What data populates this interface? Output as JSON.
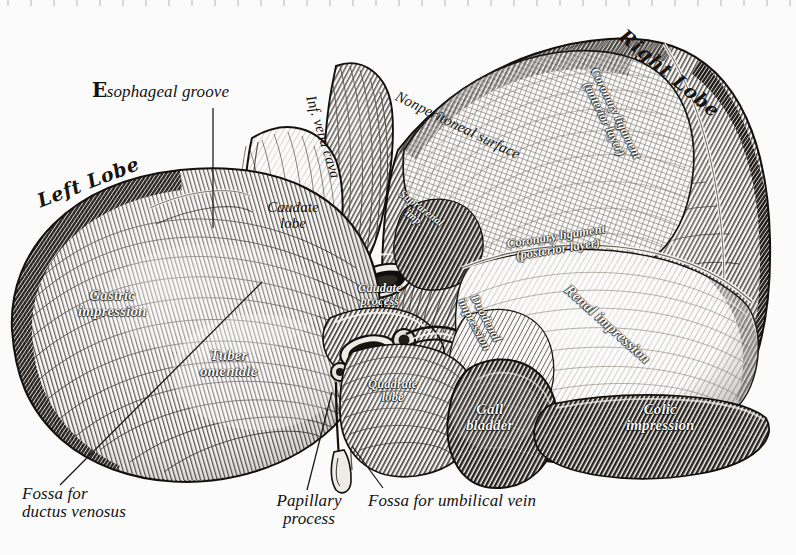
{
  "figure": {
    "style": "steel engraving, monochrome hatched line art",
    "background_color": "#ffffff",
    "ink_color": "#1a1714",
    "highlight_color": "#fdfcf8"
  },
  "labels": {
    "esophageal_groove": "Esophageal groove",
    "esophageal_groove_initial": "E",
    "esophageal_groove_rest": "sophageal groove",
    "left_lobe": "Left Lobe",
    "right_lobe": "Right Lobe",
    "caudate_lobe_l1": "Caudate",
    "caudate_lobe_l2": "lobe",
    "inf_vena_cava": "Inf. vena cava",
    "nonperitoneal_surface": "Nonperitoneal surface",
    "coronary_ligament_anterior_l1": "Coronary ligament",
    "coronary_ligament_anterior_l2": "(anterior layer)",
    "coronary_ligament_posterior_l1": "Coronary ligament",
    "coronary_ligament_posterior_l2": "(posterior layer)",
    "suprarenal_imp_l1": "Suprarenal",
    "suprarenal_imp_l2": "imp.",
    "renal_impression": "Renal impression",
    "caudate_process_l1": "Caudate",
    "caudate_process_l2": "process",
    "duodenal_impression_l1": "Duodenal",
    "duodenal_impression_l2": "impression",
    "colic_impression_l1": "Colic",
    "colic_impression_l2": "impression",
    "gall_bladder_l1": "Gall",
    "gall_bladder_l2": "bladder",
    "quadrate_lobe_l1": "Quadrate",
    "quadrate_lobe_l2": "lobe",
    "gastric_impression_l1": "Gastric",
    "gastric_impression_l2": "impression",
    "tuber_omentale_l1": "Tuber",
    "tuber_omentale_l2": "omentale",
    "fossa_ductus_venosus_l1": "Fossa for",
    "fossa_ductus_venosus_l2": "ductus venosus",
    "papillary_process_l1": "Papillary",
    "papillary_process_l2": "process",
    "fossa_umbilical_vein": "Fossa for umbilical vein"
  }
}
